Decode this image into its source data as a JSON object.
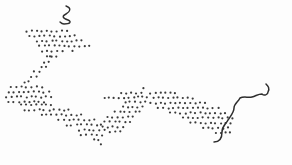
{
  "image": {
    "description": "Stippled zigzag band drawing with two hand-drawn squiggle lines",
    "width": 292,
    "height": 165,
    "background": "#fdfdfd"
  },
  "colors": {
    "dot": "#3a3a3a",
    "stroke": "#2e2e2e"
  },
  "stipple": {
    "dot_radius": 1.1,
    "spacing": 5,
    "regions": [
      {
        "name": "top-arm",
        "points": [
          [
            22,
            32
          ],
          [
            34,
            26
          ],
          [
            52,
            30
          ],
          [
            62,
            28
          ],
          [
            74,
            34
          ],
          [
            93,
            47
          ],
          [
            82,
            50
          ],
          [
            62,
            52
          ],
          [
            48,
            58
          ]
        ]
      },
      {
        "name": "upper-diagonal",
        "points": [
          [
            48,
            54
          ],
          [
            62,
            52
          ],
          [
            44,
            70
          ],
          [
            30,
            84
          ],
          [
            14,
            94
          ],
          [
            20,
            84
          ],
          [
            34,
            70
          ]
        ]
      },
      {
        "name": "left-point",
        "points": [
          [
            12,
            84
          ],
          [
            30,
            82
          ],
          [
            48,
            90
          ],
          [
            56,
            100
          ],
          [
            40,
            104
          ],
          [
            18,
            104
          ],
          [
            4,
            102
          ],
          [
            8,
            92
          ]
        ]
      },
      {
        "name": "lower-arm",
        "points": [
          [
            20,
            100
          ],
          [
            42,
            104
          ],
          [
            62,
            106
          ],
          [
            82,
            114
          ],
          [
            100,
            122
          ],
          [
            106,
            132
          ],
          [
            102,
            146
          ],
          [
            88,
            140
          ],
          [
            70,
            128
          ],
          [
            50,
            118
          ],
          [
            30,
            112
          ],
          [
            14,
            108
          ]
        ]
      },
      {
        "name": "middle-rise",
        "points": [
          [
            100,
            120
          ],
          [
            116,
            108
          ],
          [
            132,
            98
          ],
          [
            148,
            92
          ],
          [
            150,
            104
          ],
          [
            134,
            120
          ],
          [
            120,
            134
          ],
          [
            106,
            136
          ]
        ]
      },
      {
        "name": "middle-top",
        "points": [
          [
            104,
            98
          ],
          [
            122,
            92
          ],
          [
            140,
            88
          ],
          [
            150,
            88
          ],
          [
            134,
            98
          ],
          [
            116,
            102
          ]
        ]
      },
      {
        "name": "right-band",
        "points": [
          [
            150,
            88
          ],
          [
            168,
            90
          ],
          [
            190,
            96
          ],
          [
            212,
            104
          ],
          [
            232,
            114
          ],
          [
            236,
            124
          ],
          [
            228,
            138
          ],
          [
            212,
            134
          ],
          [
            196,
            126
          ],
          [
            176,
            116
          ],
          [
            160,
            110
          ],
          [
            148,
            104
          ]
        ]
      }
    ]
  },
  "strokes": [
    {
      "name": "top-squiggle",
      "d": "M66 6 C72 8 70 12 66 14 C62 16 62 18 68 20 C72 22 70 24 64 24 C62 24 61 23 60 22",
      "width": 1.4
    },
    {
      "name": "right-squiggle",
      "d": "M214 142 C220 142 222 138 222 132 C222 126 226 124 228 120 C232 114 234 112 234 108 C234 104 238 102 240 98 C244 96 248 98 252 97 C256 96 258 94 262 94 C264 96 268 95 268 92 C270 88 268 86 266 84",
      "width": 1.5
    }
  ]
}
